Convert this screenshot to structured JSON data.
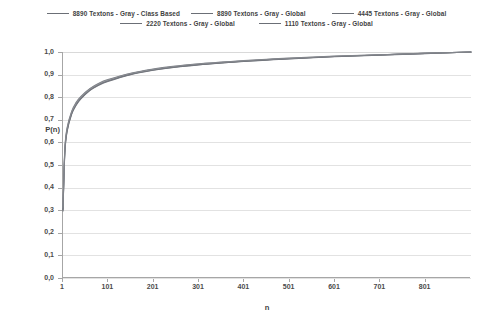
{
  "chart_data": {
    "type": "line",
    "title": "",
    "xlabel": "n",
    "ylabel": "P(n)",
    "xlim": [
      1,
      901
    ],
    "ylim": [
      0.0,
      1.0
    ],
    "grid": true,
    "legend_position": "top",
    "xticks": [
      "1",
      "101",
      "201",
      "301",
      "401",
      "501",
      "601",
      "701",
      "801"
    ],
    "xtick_values": [
      1,
      101,
      201,
      301,
      401,
      501,
      601,
      701,
      801
    ],
    "yticks": [
      "0,0",
      "0,1",
      "0,2",
      "0,3",
      "0,4",
      "0,5",
      "0,6",
      "0,7",
      "0,8",
      "0,9",
      "1,0"
    ],
    "ytick_values": [
      0.0,
      0.1,
      0.2,
      0.3,
      0.4,
      0.5,
      0.6,
      0.7,
      0.8,
      0.9,
      1.0
    ],
    "x": [
      1,
      5,
      10,
      20,
      30,
      40,
      60,
      80,
      100,
      150,
      200,
      250,
      300,
      350,
      400,
      450,
      500,
      600,
      700,
      800,
      901
    ],
    "series": [
      {
        "name": "8890 Textons - Gray - Class Based",
        "color": "#7d7f85",
        "values": [
          0.305,
          0.56,
          0.655,
          0.73,
          0.77,
          0.797,
          0.833,
          0.857,
          0.874,
          0.903,
          0.922,
          0.935,
          0.945,
          0.953,
          0.96,
          0.966,
          0.971,
          0.98,
          0.987,
          0.994,
          1.0
        ]
      },
      {
        "name": "8890 Textons - Gray - Global",
        "color": "#6f737a",
        "values": [
          0.3,
          0.555,
          0.651,
          0.727,
          0.767,
          0.794,
          0.831,
          0.855,
          0.872,
          0.901,
          0.92,
          0.934,
          0.944,
          0.952,
          0.959,
          0.965,
          0.97,
          0.98,
          0.987,
          0.994,
          1.0
        ]
      },
      {
        "name": "4445  Textons  - Gray - Global",
        "color": "#9b9ea4",
        "values": [
          0.31,
          0.566,
          0.66,
          0.734,
          0.774,
          0.8,
          0.836,
          0.86,
          0.876,
          0.905,
          0.923,
          0.937,
          0.947,
          0.954,
          0.961,
          0.967,
          0.972,
          0.981,
          0.988,
          0.994,
          1.0
        ]
      },
      {
        "name": "2220  Textons - Gray - Global",
        "color": "#74777e",
        "values": [
          0.296,
          0.551,
          0.647,
          0.724,
          0.764,
          0.791,
          0.829,
          0.853,
          0.87,
          0.9,
          0.919,
          0.933,
          0.943,
          0.951,
          0.958,
          0.964,
          0.969,
          0.979,
          0.986,
          0.993,
          1.0
        ]
      },
      {
        "name": "1110  Textons  - Gray - Global",
        "color": "#83868c",
        "values": [
          0.315,
          0.571,
          0.664,
          0.737,
          0.777,
          0.803,
          0.838,
          0.862,
          0.878,
          0.906,
          0.925,
          0.938,
          0.948,
          0.955,
          0.962,
          0.968,
          0.973,
          0.982,
          0.988,
          0.995,
          1.0
        ]
      }
    ]
  },
  "legend": {
    "rows": [
      [
        {
          "label": "8890 Textons - Gray - Class Based"
        },
        {
          "label": "8890 Textons - Gray - Global"
        },
        {
          "label": "4445  Textons  - Gray - Global"
        }
      ],
      [
        {
          "label": "2220  Textons - Gray - Global"
        },
        {
          "label": "1110  Textons  - Gray - Global"
        }
      ]
    ]
  }
}
